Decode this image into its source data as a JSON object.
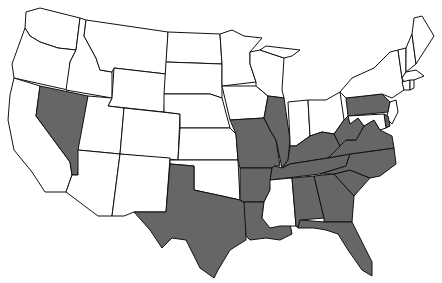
{
  "map": {
    "title": "United States",
    "colors": {
      "shaded": "#666666",
      "unshaded": "#ffffff",
      "border": "#111111"
    },
    "shaded_states": [
      "NV",
      "TX",
      "MO",
      "AR",
      "LA",
      "IL",
      "KY",
      "TN",
      "AL",
      "GA",
      "FL",
      "SC",
      "NC",
      "VA",
      "WV",
      "PA",
      "DE"
    ],
    "states": [
      {
        "id": "WA",
        "name": "Washington",
        "shaded": false
      },
      {
        "id": "OR",
        "name": "Oregon",
        "shaded": false
      },
      {
        "id": "CA",
        "name": "California",
        "shaded": false
      },
      {
        "id": "ID",
        "name": "Idaho",
        "shaded": false
      },
      {
        "id": "NV",
        "name": "Nevada",
        "shaded": true
      },
      {
        "id": "MT",
        "name": "Montana",
        "shaded": false
      },
      {
        "id": "WY",
        "name": "Wyoming",
        "shaded": false
      },
      {
        "id": "UT",
        "name": "Utah",
        "shaded": false
      },
      {
        "id": "AZ",
        "name": "Arizona",
        "shaded": false
      },
      {
        "id": "CO",
        "name": "Colorado",
        "shaded": false
      },
      {
        "id": "NM",
        "name": "New Mexico",
        "shaded": false
      },
      {
        "id": "ND",
        "name": "North Dakota",
        "shaded": false
      },
      {
        "id": "SD",
        "name": "South Dakota",
        "shaded": false
      },
      {
        "id": "NE",
        "name": "Nebraska",
        "shaded": false
      },
      {
        "id": "KS",
        "name": "Kansas",
        "shaded": false
      },
      {
        "id": "OK",
        "name": "Oklahoma",
        "shaded": false
      },
      {
        "id": "TX",
        "name": "Texas",
        "shaded": true
      },
      {
        "id": "MN",
        "name": "Minnesota",
        "shaded": false
      },
      {
        "id": "IA",
        "name": "Iowa",
        "shaded": false
      },
      {
        "id": "MO",
        "name": "Missouri",
        "shaded": true
      },
      {
        "id": "AR",
        "name": "Arkansas",
        "shaded": true
      },
      {
        "id": "LA",
        "name": "Louisiana",
        "shaded": true
      },
      {
        "id": "WI",
        "name": "Wisconsin",
        "shaded": false
      },
      {
        "id": "IL",
        "name": "Illinois",
        "shaded": true
      },
      {
        "id": "MI",
        "name": "Michigan",
        "shaded": false
      },
      {
        "id": "IN",
        "name": "Indiana",
        "shaded": false
      },
      {
        "id": "OH",
        "name": "Ohio",
        "shaded": false
      },
      {
        "id": "KY",
        "name": "Kentucky",
        "shaded": true
      },
      {
        "id": "TN",
        "name": "Tennessee",
        "shaded": true
      },
      {
        "id": "MS",
        "name": "Mississippi",
        "shaded": false
      },
      {
        "id": "AL",
        "name": "Alabama",
        "shaded": true
      },
      {
        "id": "GA",
        "name": "Georgia",
        "shaded": true
      },
      {
        "id": "FL",
        "name": "Florida",
        "shaded": true
      },
      {
        "id": "SC",
        "name": "South Carolina",
        "shaded": true
      },
      {
        "id": "NC",
        "name": "North Carolina",
        "shaded": true
      },
      {
        "id": "VA",
        "name": "Virginia",
        "shaded": true
      },
      {
        "id": "WV",
        "name": "West Virginia",
        "shaded": true
      },
      {
        "id": "PA",
        "name": "Pennsylvania",
        "shaded": true
      },
      {
        "id": "NY",
        "name": "New York",
        "shaded": false
      },
      {
        "id": "NJ",
        "name": "New Jersey",
        "shaded": false
      },
      {
        "id": "DE",
        "name": "Delaware",
        "shaded": true
      },
      {
        "id": "MD",
        "name": "Maryland",
        "shaded": false
      },
      {
        "id": "VT",
        "name": "Vermont",
        "shaded": false
      },
      {
        "id": "NH",
        "name": "New Hampshire",
        "shaded": false
      },
      {
        "id": "ME",
        "name": "Maine",
        "shaded": false
      },
      {
        "id": "MA",
        "name": "Massachusetts",
        "shaded": false
      },
      {
        "id": "CT",
        "name": "Connecticut",
        "shaded": false
      },
      {
        "id": "RI",
        "name": "Rhode Island",
        "shaded": false
      }
    ]
  }
}
